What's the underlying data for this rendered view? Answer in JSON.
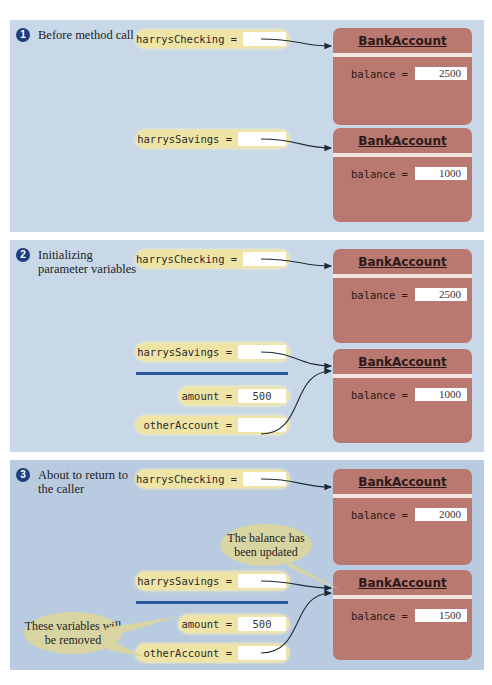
{
  "panels": [
    {
      "step": "1",
      "label": "Before method call",
      "variables": [
        {
          "name": "harrysChecking =",
          "value": ""
        },
        {
          "name": "harrysSavings =",
          "value": ""
        }
      ],
      "objects": [
        {
          "class": "BankAccount",
          "field": "balance =",
          "value": "2500"
        },
        {
          "class": "BankAccount",
          "field": "balance =",
          "value": "1000"
        }
      ]
    },
    {
      "step": "2",
      "label": "Initializing parameter variables",
      "variables": [
        {
          "name": "harrysChecking =",
          "value": ""
        },
        {
          "name": "harrysSavings =",
          "value": ""
        },
        {
          "name": "amount =",
          "value": "500"
        },
        {
          "name": "otherAccount =",
          "value": ""
        }
      ],
      "objects": [
        {
          "class": "BankAccount",
          "field": "balance =",
          "value": "2500"
        },
        {
          "class": "BankAccount",
          "field": "balance =",
          "value": "1000"
        }
      ]
    },
    {
      "step": "3",
      "label": "About to return to the caller",
      "variables": [
        {
          "name": "harrysChecking =",
          "value": ""
        },
        {
          "name": "harrysSavings =",
          "value": ""
        },
        {
          "name": "amount =",
          "value": "500"
        },
        {
          "name": "otherAccount =",
          "value": ""
        }
      ],
      "objects": [
        {
          "class": "BankAccount",
          "field": "balance =",
          "value": "2000"
        },
        {
          "class": "BankAccount",
          "field": "balance =",
          "value": "1500"
        }
      ],
      "callouts": [
        {
          "text": "The balance has been updated"
        },
        {
          "text": "These variables will be removed"
        }
      ]
    }
  ],
  "colors": {
    "panel_bg": "#c9d8e8",
    "variable_bg": "#efe4a6",
    "object_bg": "#b97870",
    "step_badge": "#1d3f7c",
    "divider": "#2a5a9e",
    "callout_bg": "#d8d5a2"
  }
}
